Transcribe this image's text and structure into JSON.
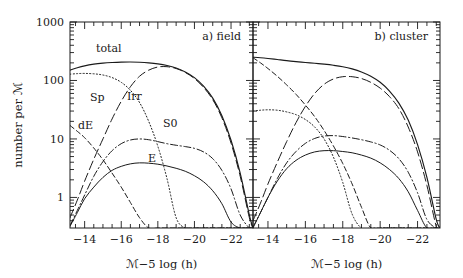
{
  "figure": {
    "name": "galaxy-luminosity-function-figure",
    "background": "#ffffff",
    "ink": "#1a1a1a",
    "width": 463,
    "height": 278
  },
  "axes": {
    "y_title": "number per ℳ",
    "x_title": "ℳ−5 log (h)",
    "y_ticklabels": [
      "1000",
      "100",
      "10",
      "1"
    ],
    "y_tickvalues": [
      1000,
      100,
      10,
      1
    ],
    "ylim": [
      0.3,
      1000
    ],
    "yscale": "log",
    "xlim": [
      -13.2,
      -23.2
    ],
    "x_ticklabels": [
      "−14",
      "−16",
      "−18",
      "−20",
      "−22"
    ],
    "x_tickvalues": [
      -14,
      -16,
      -18,
      -20,
      -22
    ],
    "grid": false,
    "ticks_direction": "in",
    "minor_ticks": true
  },
  "panels": [
    {
      "key": "field",
      "title": "a) field"
    },
    {
      "key": "cluster",
      "title": "b) cluster"
    }
  ],
  "curve_labels_field": [
    {
      "text": "total",
      "x": 96,
      "y": 52
    },
    {
      "text": "Sp",
      "x": 90,
      "y": 101
    },
    {
      "text": "Irr",
      "x": 127,
      "y": 100
    },
    {
      "text": "dE",
      "x": 78,
      "y": 129
    },
    {
      "text": "S0",
      "x": 163,
      "y": 127
    },
    {
      "text": "E",
      "x": 148,
      "y": 162
    }
  ],
  "chart_data": {
    "type": "line",
    "title": "",
    "xlabel": "ℳ−5 log (h)",
    "ylabel": "number per ℳ",
    "xlim": [
      -13.2,
      -23.2
    ],
    "ylim": [
      0.3,
      1000
    ],
    "yscale": "log",
    "xscale": "linear",
    "grid": false,
    "legend": "inline curve labels",
    "x": [
      -13.2,
      -13.6,
      -14.0,
      -14.5,
      -15.0,
      -15.5,
      -16.0,
      -16.5,
      -17.0,
      -17.5,
      -18.0,
      -18.5,
      -19.0,
      -19.5,
      -20.0,
      -20.5,
      -21.0,
      -21.5,
      -22.0,
      -22.5,
      -23.0,
      -23.2
    ],
    "panels": [
      {
        "name": "a) field",
        "series": [
          {
            "name": "total",
            "style": "solid",
            "values": [
              150,
              165,
              178,
              190,
              198,
              203,
              206,
              207,
              205,
              200,
              192,
              180,
              163,
              140,
              112,
              80,
              50,
              25,
              9.5,
              2.6,
              0.5,
              0.3
            ]
          },
          {
            "name": "Sp",
            "style": "long-dash",
            "values": [
              0.45,
              0.9,
              1.9,
              4.5,
              10,
              22,
              44,
              78,
              118,
              150,
              170,
              172,
              160,
              137,
              108,
              76,
              47,
              23,
              8.5,
              2.3,
              0.45,
              0.3
            ]
          },
          {
            "name": "Irr",
            "style": "dotted",
            "values": [
              128,
              131,
              132,
              130,
              124,
              112,
              93,
              68,
              42,
              20,
              7.5,
              2.1,
              0.45,
              0.3,
              0.3,
              0.3,
              0.3,
              0.3,
              0.3,
              0.3,
              0.3,
              0.3
            ]
          },
          {
            "name": "dE",
            "style": "dashed",
            "values": [
              17,
              13.5,
              10.5,
              7.0,
              4.4,
              2.6,
              1.5,
              0.82,
              0.45,
              0.3,
              0.3,
              0.3,
              0.3,
              0.3,
              0.3,
              0.3,
              0.3,
              0.3,
              0.3,
              0.3,
              0.3,
              0.3
            ]
          },
          {
            "name": "S0",
            "style": "dash-dot",
            "values": [
              0.33,
              0.6,
              1.1,
              2.3,
              4.1,
              6.3,
              8.3,
              9.6,
              10.0,
              9.7,
              9.0,
              8.3,
              7.8,
              7.4,
              6.9,
              6.0,
              4.6,
              2.9,
              1.4,
              0.5,
              0.3,
              0.3
            ]
          },
          {
            "name": "E",
            "style": "solid-thin",
            "values": [
              0.32,
              0.55,
              0.95,
              1.5,
              2.2,
              2.9,
              3.4,
              3.75,
              3.9,
              3.85,
              3.7,
              3.45,
              3.15,
              2.8,
              2.35,
              1.85,
              1.3,
              0.78,
              0.38,
              0.3,
              0.3,
              0.3
            ]
          }
        ]
      },
      {
        "name": "b) cluster",
        "series": [
          {
            "name": "total",
            "style": "solid",
            "values": [
              250,
              245,
              238,
              228,
              218,
              210,
              203,
              197,
              190,
              182,
              172,
              158,
              140,
              118,
              93,
              66,
              41,
              21,
              8.0,
              2.2,
              0.42,
              0.3
            ]
          },
          {
            "name": "Sp",
            "style": "long-dash",
            "values": [
              0.4,
              0.8,
              1.7,
              4.0,
              9.0,
              19,
              36,
              60,
              86,
              106,
              116,
              116,
              108,
              93,
              74,
              53,
              33,
              16,
              6.0,
              1.6,
              0.32,
              0.3
            ]
          },
          {
            "name": "Irr",
            "style": "dotted",
            "values": [
              30,
              31,
              31.5,
              31,
              29,
              26,
              21.5,
              16,
              10,
              4.9,
              1.8,
              0.52,
              0.3,
              0.3,
              0.3,
              0.3,
              0.3,
              0.3,
              0.3,
              0.3,
              0.3,
              0.3
            ]
          },
          {
            "name": "dE",
            "style": "dashed",
            "values": [
              245,
              200,
              160,
              118,
              84,
              58,
              38,
              24,
              14,
              7.6,
              3.8,
              1.7,
              0.68,
              0.3,
              0.3,
              0.3,
              0.3,
              0.3,
              0.3,
              0.3,
              0.3,
              0.3
            ]
          },
          {
            "name": "S0",
            "style": "dash-dot",
            "values": [
              0.31,
              0.55,
              1.0,
              2.1,
              3.9,
              6.1,
              8.4,
              10.2,
              11.2,
              11.4,
              11.0,
              10.4,
              9.7,
              8.9,
              7.9,
              6.4,
              4.6,
              2.7,
              1.2,
              0.42,
              0.3,
              0.3
            ]
          },
          {
            "name": "E",
            "style": "solid-thin",
            "values": [
              0.3,
              0.55,
              1.0,
              1.9,
              3.1,
              4.3,
              5.3,
              6.0,
              6.3,
              6.3,
              6.1,
              5.8,
              5.3,
              4.7,
              3.9,
              3.0,
              2.1,
              1.25,
              0.6,
              0.3,
              0.3,
              0.3
            ]
          }
        ]
      }
    ]
  }
}
